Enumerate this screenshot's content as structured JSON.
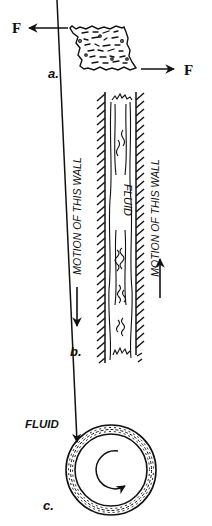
{
  "figure": {
    "panel_a": {
      "caption": "a.",
      "force_left_label": "F",
      "force_right_label": "F"
    },
    "panel_b": {
      "caption": "b.",
      "fluid_label": "FLUID",
      "left_wall_label": "MOTION OF THIS WALL",
      "right_wall_label": "MOTION OF THIS WALL",
      "left_wall_direction": "down",
      "right_wall_direction": "up"
    },
    "panel_c": {
      "caption": "c.",
      "fluid_label": "FLUID",
      "rotation_direction": "clockwise"
    },
    "colors": {
      "ink": "#111111",
      "background": "#ffffff"
    }
  }
}
